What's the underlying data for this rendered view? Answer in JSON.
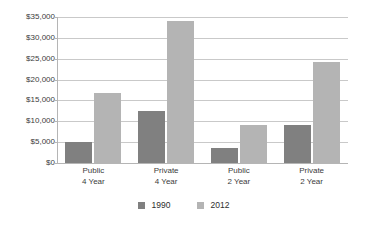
{
  "chart_data": {
    "type": "bar",
    "title": "",
    "subtitle": "",
    "xlabel": "",
    "ylabel": "",
    "categories": [
      "Public 4 Year",
      "Private 4 Year",
      "Public 2 Year",
      "Private 2 Year"
    ],
    "category_lines": [
      [
        "Public",
        "4 Year"
      ],
      [
        "Private",
        "4 Year"
      ],
      [
        "Public",
        "2 Year"
      ],
      [
        "Private",
        "2 Year"
      ]
    ],
    "series": [
      {
        "name": "1990",
        "color": "#808080",
        "values": [
          5000,
          12400,
          3600,
          9200
        ]
      },
      {
        "name": "2012",
        "color": "#b4b4b4",
        "values": [
          16900,
          34000,
          9000,
          24100
        ]
      }
    ],
    "ylim": [
      0,
      35000
    ],
    "ytick_values": [
      0,
      5000,
      10000,
      15000,
      20000,
      25000,
      30000,
      35000
    ],
    "ytick_labels": [
      "$0",
      "$5,000",
      "$10,000",
      "$15,000",
      "$20,000",
      "$25,000",
      "$30,000",
      "$35,000"
    ],
    "grid": true,
    "grid_axis": "y",
    "legend_position": "bottom"
  },
  "legend": {
    "items": [
      {
        "label": "1990",
        "color": "#808080"
      },
      {
        "label": "2012",
        "color": "#b4b4b4"
      }
    ]
  },
  "colors": {
    "background": "#ffffff",
    "gridline": "#c9c9c9",
    "axis": "#b5b5b5",
    "text": "#3c3c3c",
    "series_1990": "#808080",
    "series_2012": "#b4b4b4"
  }
}
